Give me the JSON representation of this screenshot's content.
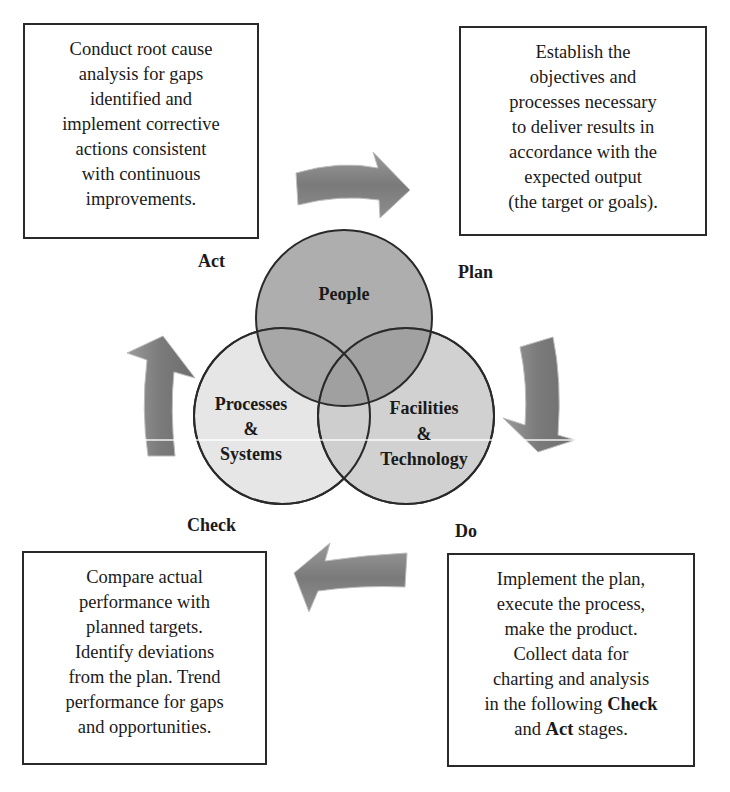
{
  "cycle": {
    "act": {
      "label": "Act",
      "description": "Conduct root cause analysis for gaps identified and implement corrective actions consistent with continuous improvements.",
      "lines": [
        "Conduct root cause",
        "analysis for gaps",
        "identified and",
        "implement corrective",
        "actions consistent",
        "with continuous",
        "improvements."
      ]
    },
    "plan": {
      "label": "Plan",
      "description": "Establish the objectives and processes necessary to deliver results in accordance with the expected output (the target or goals).",
      "lines": [
        "Establish the",
        "objectives and",
        "processes necessary",
        "to deliver results in",
        "accordance with the",
        "expected output",
        "(the target or goals)."
      ]
    },
    "do": {
      "label": "Do",
      "lines": [
        "Implement the plan,",
        "execute the process,",
        "make the product.",
        "Collect data for",
        "charting and analysis"
      ],
      "line6_prefix": "in the following ",
      "line6_bold": "Check",
      "line7_prefix": "and ",
      "line7_bold": "Act",
      "line7_suffix": " stages."
    },
    "check": {
      "label": "Check",
      "description": "Compare actual performance with planned targets. Identify deviations from the plan. Trend performance for gaps and opportunities.",
      "lines": [
        "Compare actual",
        "performance with",
        "planned targets.",
        "Identify deviations",
        "from the plan. Trend",
        "performance for gaps",
        "and opportunities."
      ]
    }
  },
  "venn": {
    "people": "People",
    "processes_line1": "Processes",
    "processes_line2": "&",
    "processes_line3": "Systems",
    "facilities_line1": "Facilities",
    "facilities_line2": "&",
    "facilities_line3": "Technology"
  },
  "colors": {
    "people_fill": "#9a9a9a",
    "processes_fill": "#e6e6e6",
    "facilities_fill": "#c9c9c9",
    "arrow_fill": "#7d7d7d",
    "outline": "#2a2a2a"
  },
  "arrows": [
    {
      "name": "act-to-plan",
      "direction": "right"
    },
    {
      "name": "plan-to-do",
      "direction": "down"
    },
    {
      "name": "do-to-check",
      "direction": "left"
    },
    {
      "name": "check-to-act",
      "direction": "up"
    }
  ]
}
